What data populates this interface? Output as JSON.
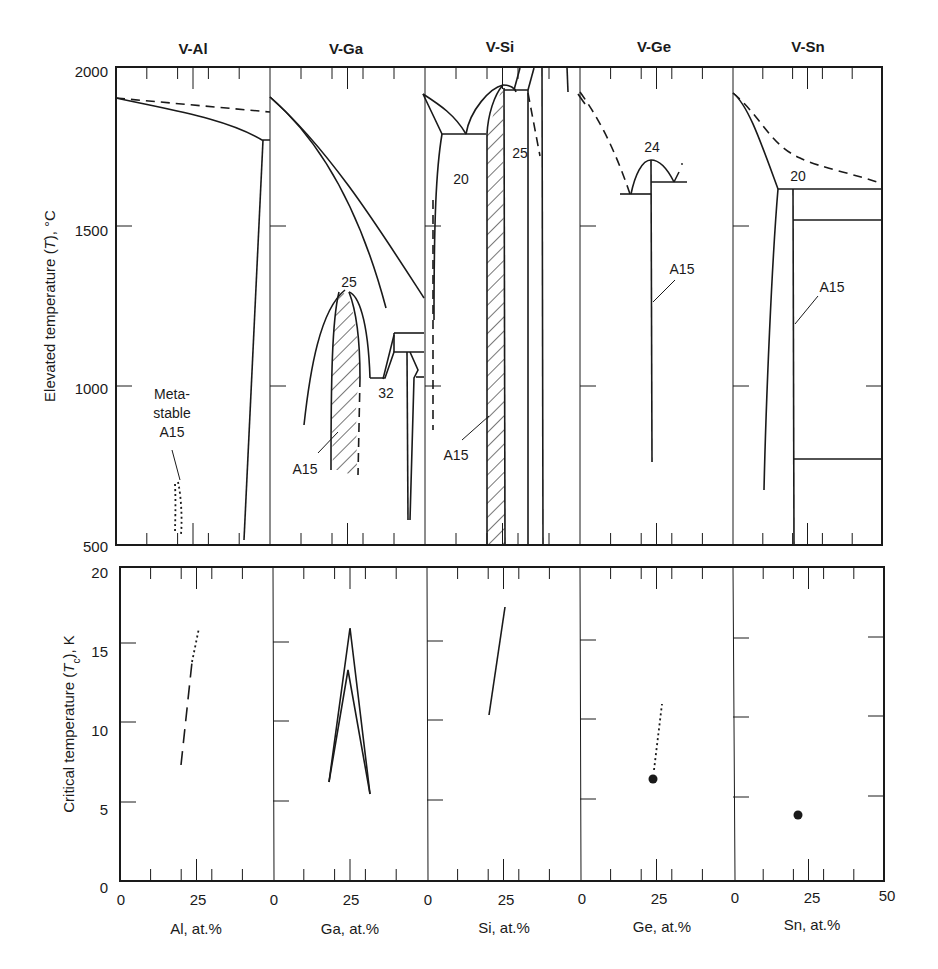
{
  "figure": {
    "panel_titles": [
      "V-Al",
      "V-Ga",
      "V-Si",
      "V-Ge",
      "V-Sn"
    ],
    "top_ylabel_prefix": "Elevated temperature (",
    "top_ylabel_sym": "T",
    "top_ylabel_suffix": "), °C",
    "bottom_ylabel_prefix": "Critical temperature (",
    "bottom_ylabel_sym": "T",
    "bottom_ylabel_sub": "c",
    "bottom_ylabel_suffix": "), K",
    "top_yticks": [
      "2000",
      "1500",
      "1000",
      "500"
    ],
    "bottom_yticks": [
      "20",
      "15",
      "10",
      "5",
      "0"
    ],
    "xtick_zero": "0",
    "xtick_mid": "25",
    "xtick_end": "50",
    "xlabels": [
      "Al, at.%",
      "Ga, at.%",
      "Si, at.%",
      "Ge, at.%",
      "Sn, at.%"
    ],
    "annotations": {
      "al_metastable_1": "Meta-",
      "al_metastable_2": "stable",
      "al_metastable_3": "A15",
      "ga_peak": "25",
      "ga_eutectic": "32",
      "ga_a15": "A15",
      "si_eutectic": "20",
      "si_peak": "25",
      "si_a15": "A15",
      "ge_peak": "24",
      "ge_a15": "A15",
      "sn_peritectic": "20",
      "sn_a15": "A15"
    }
  },
  "chart_data": [
    {
      "type": "line",
      "title": "Phase diagrams of V-X systems (A15 phase regions)",
      "panels": [
        "V-Al",
        "V-Ga",
        "V-Si",
        "V-Ge",
        "V-Sn"
      ],
      "xlabel": "X, at.% (0–50 per panel)",
      "ylabel": "Elevated temperature (T), °C",
      "ylim": [
        500,
        2000
      ],
      "yticks": [
        500,
        1000,
        1500,
        2000
      ],
      "xticks": [
        0,
        25,
        50
      ],
      "grid": false,
      "annotations": [
        {
          "panel": "V-Al",
          "text": "Metastable A15",
          "x": 20,
          "y": 600
        },
        {
          "panel": "V-Ga",
          "text": "25",
          "x": 25,
          "y": 1300,
          "note": "A15 congruent max ≈1300 °C at 25 at.%"
        },
        {
          "panel": "V-Ga",
          "text": "32",
          "x": 32,
          "y": 1030
        },
        {
          "panel": "V-Ga",
          "text": "A15",
          "x": 22,
          "y": 850
        },
        {
          "panel": "V-Si",
          "text": "20",
          "x": 20,
          "y": 1800,
          "note": "eutectic ≈1800 °C"
        },
        {
          "panel": "V-Si",
          "text": "25",
          "x": 25,
          "y": 1950,
          "note": "A15 congruent max ≈1930 °C"
        },
        {
          "panel": "V-Si",
          "text": "A15",
          "x": 22,
          "y": 850
        },
        {
          "panel": "V-Ge",
          "text": "24",
          "x": 24,
          "y": 1710,
          "note": "A15 max ≈1710 °C"
        },
        {
          "panel": "V-Ge",
          "text": "A15",
          "x": 24,
          "y": 1300
        },
        {
          "panel": "V-Sn",
          "text": "20",
          "x": 20,
          "y": 1620,
          "note": "peritectic ≈1620 °C"
        },
        {
          "panel": "V-Sn",
          "text": "A15",
          "x": 20,
          "y": 1200
        }
      ],
      "series": [
        {
          "name": "V-Al liquidus (dashed)",
          "x": [
            0,
            50
          ],
          "y": [
            1910,
            1860
          ]
        },
        {
          "name": "V-Al solidus",
          "x": [
            0,
            20,
            35,
            47
          ],
          "y": [
            1910,
            1870,
            1840,
            1780
          ]
        },
        {
          "name": "V-Al solvus",
          "x": [
            47,
            44
          ],
          "y": [
            1780,
            520
          ]
        },
        {
          "name": "V-Al metastable A15",
          "x": [
            20,
            21
          ],
          "y": [
            690,
            550
          ]
        },
        {
          "name": "V-Ga A15 region",
          "x": [
            18,
            25,
            30
          ],
          "y": [
            740,
            1300,
            720
          ]
        },
        {
          "name": "V-Ge A15 line",
          "x": [
            24,
            24
          ],
          "y": [
            770,
            1610
          ]
        },
        {
          "name": "V-Sn A15 line",
          "x": [
            20,
            20
          ],
          "y": [
            500,
            1620
          ]
        }
      ]
    },
    {
      "type": "line",
      "title": "Superconducting critical temperature of A15 phases",
      "panels": [
        "V-Al",
        "V-Ga",
        "V-Si",
        "V-Ge",
        "V-Sn"
      ],
      "xlabel": "X, at.% (0–50 per panel)",
      "ylabel": "Critical temperature (Tc), K",
      "ylim": [
        0,
        20
      ],
      "yticks": [
        0,
        5,
        10,
        15,
        20
      ],
      "xticks": [
        0,
        25,
        50
      ],
      "grid": false,
      "series": [
        {
          "name": "V-Al (dashed, extrapolated dotted)",
          "x": [
            20,
            23,
            25
          ],
          "y": [
            7.3,
            13.5,
            16.0
          ]
        },
        {
          "name": "V-Ga upper",
          "x": [
            18,
            25,
            30
          ],
          "y": [
            6.3,
            16.0,
            5.5
          ]
        },
        {
          "name": "V-Ga lower",
          "x": [
            18,
            24.5,
            30
          ],
          "y": [
            6.3,
            13.2,
            5.5
          ]
        },
        {
          "name": "V-Si",
          "x": [
            20,
            25
          ],
          "y": [
            10.4,
            17.2
          ]
        },
        {
          "name": "V-Ge point",
          "x": [
            23.5
          ],
          "y": [
            6.5
          ]
        },
        {
          "name": "V-Ge extrapolated (dotted)",
          "x": [
            23.5,
            26
          ],
          "y": [
            7.0,
            11.0
          ]
        },
        {
          "name": "V-Sn point",
          "x": [
            20.5
          ],
          "y": [
            4.2
          ]
        }
      ]
    }
  ]
}
